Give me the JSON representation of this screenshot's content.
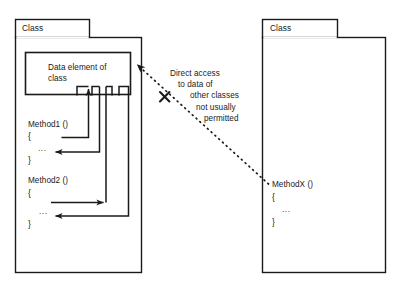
{
  "diagram": {
    "colors": {
      "stroke": "#1a1a1a",
      "background": "#ffffff",
      "text": "#1a1a1a",
      "dotted": "#1a1a1a",
      "ellipsis": "#3a3a3a"
    },
    "left_class": {
      "tab_label": "Class",
      "data_box_label": "Data element of class",
      "methods": [
        {
          "signature": "Method1 ()",
          "open_brace": "{",
          "body": "...",
          "close_brace": "}"
        },
        {
          "signature": "Method2 ()",
          "open_brace": "{",
          "body": "...",
          "close_brace": "}"
        }
      ]
    },
    "right_class": {
      "tab_label": "Class",
      "methods": [
        {
          "signature": "MethodX ()",
          "open_brace": "{",
          "body": "...",
          "close_brace": "}"
        }
      ]
    },
    "annotation": {
      "line1": "Direct access",
      "line2": "to data of",
      "line3": "other classes",
      "line4": "not usually",
      "line5": "permitted",
      "forbidden_marker": "X"
    }
  }
}
